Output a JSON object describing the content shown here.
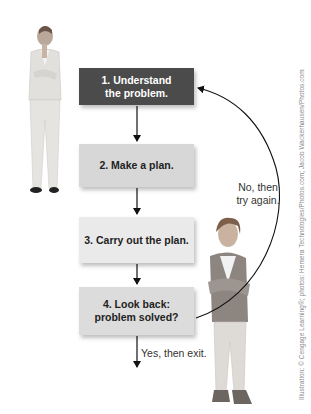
{
  "diagram": {
    "steps": [
      {
        "number": 1,
        "label": "1. Understand the problem.",
        "line1": "1. Understand",
        "line2": "the problem.",
        "fill": "#4b4b4b"
      },
      {
        "number": 2,
        "label": "2. Make a plan.",
        "fill": "#d7d7d7"
      },
      {
        "number": 3,
        "label": "3. Carry out the plan.",
        "fill": "#eaeaea"
      },
      {
        "number": 4,
        "label": "4. Look back: problem solved?",
        "line1": "4. Look back:",
        "line2": "problem solved?",
        "fill": "#dcdcdc"
      }
    ],
    "loop_label": {
      "line1": "No, then",
      "line2": "try again."
    },
    "exit_label": "Yes, then exit.",
    "credit": "Illustration: © Cengage Learning®; photos: Hemera Technologies/Photos.com; Jacob Wackerhausen/Photos.com"
  },
  "photos": [
    {
      "name": "woman-in-suit-thinking",
      "description": "Woman in suit, hand on chin"
    },
    {
      "name": "woman-arms-crossed-smiling",
      "description": "Smiling woman with arms crossed"
    }
  ]
}
